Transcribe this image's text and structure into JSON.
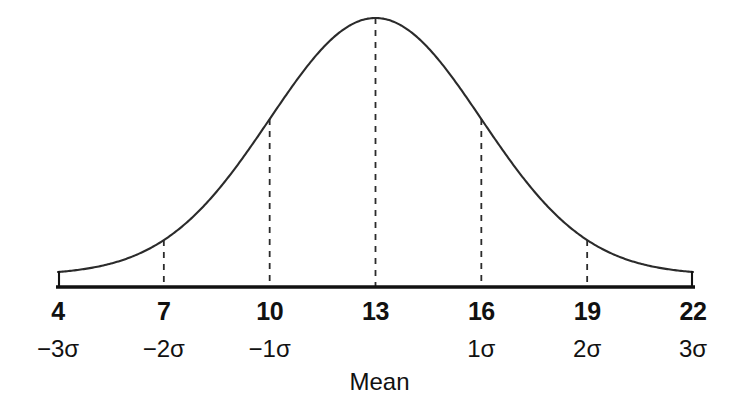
{
  "chart_data": {
    "type": "line",
    "title": "",
    "subtitle": "",
    "xlabel": "Mean",
    "ylabel": "",
    "grid": false,
    "legend": false,
    "curve": "normal distribution bell curve",
    "distribution": {
      "mean": 13,
      "sigma": 3,
      "peak_value_label": "13"
    },
    "xlim": [
      4,
      22
    ],
    "x_ticks": [
      4,
      7,
      10,
      13,
      16,
      19,
      22
    ],
    "x_tick_labels": [
      "4",
      "7",
      "10",
      "13",
      "16",
      "19",
      "22"
    ],
    "sigma_tick_labels": [
      "−3σ",
      "−2σ",
      "−1σ",
      "",
      "1σ",
      "2σ",
      "3σ"
    ],
    "dashed_verticals_at": [
      7,
      10,
      13,
      16,
      19
    ],
    "annotations": [
      "Mean"
    ],
    "series": [
      {
        "name": "normal-curve",
        "x": [
          4,
          5,
          6,
          7,
          8,
          9,
          10,
          11,
          12,
          13,
          14,
          15,
          16,
          17,
          18,
          19,
          20,
          21,
          22
        ],
        "y": [
          0.011,
          0.027,
          0.054,
          0.105,
          0.189,
          0.317,
          0.487,
          0.677,
          0.857,
          1.0,
          0.857,
          0.677,
          0.487,
          0.317,
          0.189,
          0.105,
          0.054,
          0.027,
          0.011
        ]
      }
    ]
  },
  "axis": {
    "numbers": [
      {
        "value": "4",
        "x": 4
      },
      {
        "value": "7",
        "x": 7
      },
      {
        "value": "10",
        "x": 10
      },
      {
        "value": "13",
        "x": 13
      },
      {
        "value": "16",
        "x": 16
      },
      {
        "value": "19",
        "x": 19
      },
      {
        "value": "22",
        "x": 22
      }
    ],
    "sigmas": [
      {
        "value": "−3σ",
        "x": 4
      },
      {
        "value": "−2σ",
        "x": 7
      },
      {
        "value": "−1σ",
        "x": 10
      },
      {
        "value": "1σ",
        "x": 16
      },
      {
        "value": "2σ",
        "x": 19
      },
      {
        "value": "3σ",
        "x": 22
      }
    ]
  },
  "labels": {
    "mean": "Mean"
  },
  "colors": {
    "ink": "#111111",
    "curve": "#2b2b2b",
    "dash": "#2b2b2b",
    "background": "#ffffff"
  }
}
